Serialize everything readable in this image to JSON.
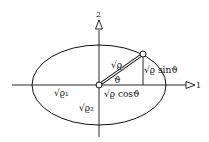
{
  "diagram": {
    "type": "ellipse-geometry",
    "colors": {
      "stroke": "#111111",
      "background": "#ffffff"
    },
    "axes": {
      "horizontal_label": "1",
      "vertical_label": "2"
    },
    "labels": {
      "radius": "√ϱ",
      "angle": "ϑ",
      "x_projection": "√ϱ cosϑ",
      "y_projection": "√ϱ sinϑ",
      "semi_axis_1": "√ϱ₁",
      "semi_axis_2": "√ϱ₂"
    }
  }
}
